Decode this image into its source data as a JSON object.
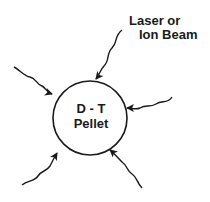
{
  "diagram": {
    "pellet": {
      "line1": "D - T",
      "line2": "Pellet"
    },
    "beam_label": {
      "line1": "Laser or",
      "line2": "Ion Beam"
    },
    "colors": {
      "stroke": "#1a1a1a",
      "background": "#ffffff"
    },
    "beams": [
      {
        "id": "top"
      },
      {
        "id": "upper-left"
      },
      {
        "id": "right"
      },
      {
        "id": "lower-left"
      },
      {
        "id": "lower-right"
      }
    ]
  }
}
